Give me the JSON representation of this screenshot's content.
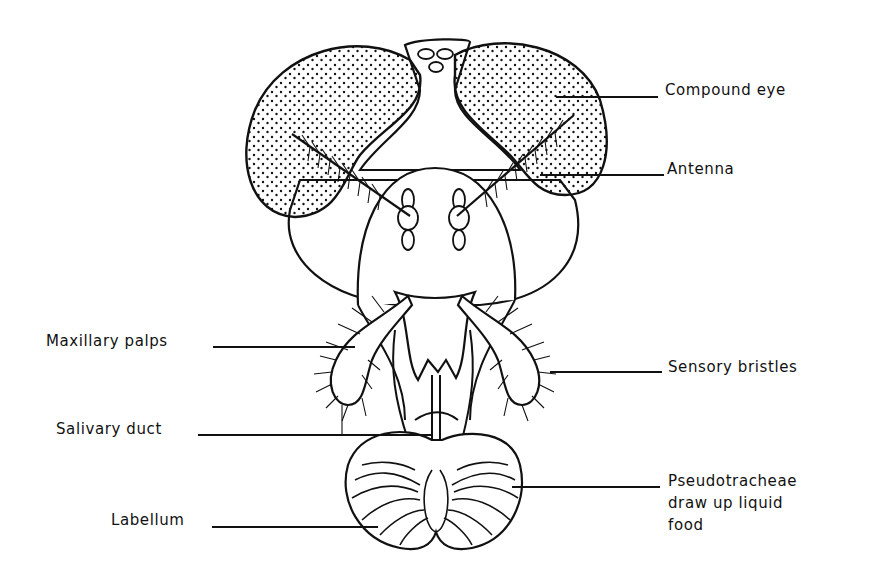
{
  "labels": {
    "compound_eye": "Compound eye",
    "antenna": "Antenna",
    "maxillary_palps": "Maxillary palps",
    "sensory_bristles": "Sensory bristles",
    "salivary_duct": "Salivary duct",
    "pseudotracheae": "Pseudotracheae\ndraw up liquid\nfood",
    "labellum": "Labellum"
  },
  "colors": {
    "ink": "#111111",
    "background": "#ffffff"
  }
}
